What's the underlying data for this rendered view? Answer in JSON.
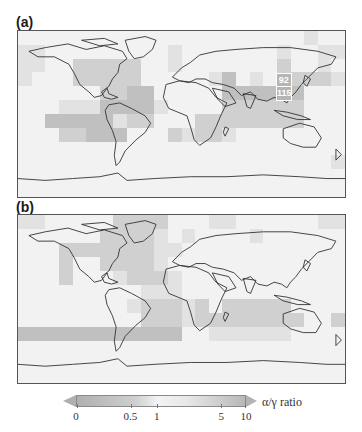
{
  "panels": [
    {
      "id": "a",
      "label": "(a)",
      "grid_rows": 12,
      "grid_cols": 24,
      "shade_levels": [
        "000000000000000000000100",
        "110000000001000000010011",
        "110022222001000000020010",
        "100022222000001301022221",
        "000000223300000333323000",
        "000111333310000222222000",
        "003333312200022222222000",
        "000223330002122100000000",
        "000000000000000000000000",
        "000000000000000000000001",
        "000000000000000000000000",
        "000000000000000000000000"
      ],
      "station_labels": [
        {
          "text": "92",
          "col": 19,
          "row": 3
        },
        {
          "text": "115",
          "col": 19,
          "row": 4
        }
      ]
    },
    {
      "id": "b",
      "label": "(b)",
      "grid_rows": 12,
      "grid_cols": 24,
      "shade_levels": [
        "110000022220001100000011",
        "000000222210100001000000",
        "000222222211000000000000",
        "000200222210000000000000",
        "000200012221000000000000",
        "000000000111000000000000",
        "000000001222120222220000",
        "000000000222122222222002",
        "333333333333001111110000",
        "000000000000000000000000",
        "000000000000000000000000",
        "000000000000000000000000"
      ],
      "station_labels": []
    }
  ],
  "colorbar": {
    "title": "α/γ ratio",
    "ticks": [
      {
        "label": "0",
        "pos": 0.0
      },
      {
        "label": "0.5",
        "pos": 0.32
      },
      {
        "label": "1",
        "pos": 0.475
      },
      {
        "label": "5",
        "pos": 0.855
      },
      {
        "label": "10",
        "pos": 1.0
      }
    ],
    "extend": "both",
    "colors": {
      "low": "#b0b0b0",
      "mid": "#f3f3f3",
      "high": "#b8b8b8"
    }
  }
}
